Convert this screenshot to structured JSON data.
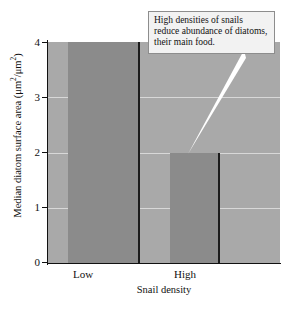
{
  "chart_data": {
    "type": "bar",
    "title": "",
    "categories": [
      "Low",
      "High"
    ],
    "values": [
      4,
      2
    ],
    "xlabel": "Snail density",
    "ylabel": "Median diatom surface area (μm²/μm²)",
    "ylim": [
      0,
      4
    ],
    "ytick_labels": [
      "0",
      "1",
      "2",
      "3",
      "4"
    ],
    "ytick_values": [
      0,
      1,
      2,
      3,
      4
    ],
    "grid": true,
    "legend": "none",
    "annotations": [
      {
        "text": "High densities of snails reduce abundance of diatoms, their main food.",
        "points_to": "High"
      }
    ],
    "colors": {
      "bar_fill": "#8b8b8b",
      "bar_edge": "#1c1c1c",
      "plot_background": "#a9a9a9",
      "gridline": "#d8d8d8",
      "axis": "#111111",
      "callout_background": "#f2f2f2",
      "callout_border": "#8d8d8d",
      "leader_line": "#ffffff",
      "page_background": "#ffffff"
    }
  },
  "axes": {
    "y_title_main": "Median diatom surface area (μm",
    "y_title_sup1": "2",
    "y_title_mid": "/μm",
    "y_title_sup2": "2",
    "y_title_end": ")",
    "x_title": "Snail density",
    "ticks": [
      {
        "label": "4",
        "value": 4
      },
      {
        "label": "3",
        "value": 3
      },
      {
        "label": "2",
        "value": 2
      },
      {
        "label": "1",
        "value": 1
      },
      {
        "label": "0",
        "value": 0
      }
    ],
    "categories": [
      {
        "label": "Low",
        "value": 4
      },
      {
        "label": "High",
        "value": 2
      }
    ]
  },
  "callout": {
    "text": "High densities of snails reduce abundance of diatoms, their main food."
  }
}
